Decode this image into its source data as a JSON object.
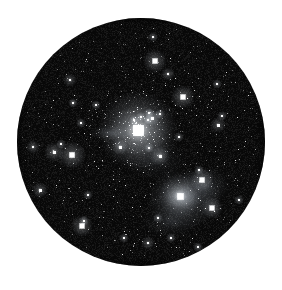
{
  "figure": {
    "kind": "astronomical-photograph",
    "presentation": "circular telescope field of view on white page",
    "caption": "",
    "background_color": "#ffffff",
    "sky_color": "#080808",
    "star_color": "#ffffff",
    "nebula_color": "#8f96a0"
  },
  "disc": {
    "center_x": 141,
    "center_y": 142,
    "radius": 124,
    "edge_softness_px": 2
  },
  "nebulae": [
    {
      "name": "central-glow",
      "x": 139,
      "y": 131,
      "rx": 30,
      "ry": 26,
      "intensity": 0.5,
      "tint": "#b9c2cc"
    },
    {
      "name": "western-streak",
      "x": 110,
      "y": 133,
      "rx": 22,
      "ry": 8,
      "intensity": 0.3,
      "tint": "#9aa3ad"
    },
    {
      "name": "southeast-complex",
      "x": 184,
      "y": 199,
      "rx": 38,
      "ry": 30,
      "intensity": 0.4,
      "tint": "#99a2ad"
    },
    {
      "name": "southeast-core",
      "x": 180,
      "y": 196,
      "rx": 16,
      "ry": 13,
      "intensity": 0.45,
      "tint": "#b3bcc6"
    },
    {
      "name": "southeast-extension",
      "x": 205,
      "y": 186,
      "rx": 26,
      "ry": 20,
      "intensity": 0.26,
      "tint": "#8d96a1"
    },
    {
      "name": "lower-haze",
      "x": 170,
      "y": 222,
      "rx": 30,
      "ry": 16,
      "intensity": 0.2,
      "tint": "#848d98"
    },
    {
      "name": "midfield-haze",
      "x": 155,
      "y": 160,
      "rx": 34,
      "ry": 22,
      "intensity": 0.16,
      "tint": "#7e8792"
    }
  ],
  "bright_stars": [
    {
      "name": "alpha-core",
      "x": 138,
      "y": 130,
      "size": 17,
      "halo": 40,
      "brightness": 1.0
    },
    {
      "name": "se-bright",
      "x": 180,
      "y": 196,
      "size": 9,
      "halo": 22,
      "brightness": 0.92
    },
    {
      "name": "w-pair-a",
      "x": 72,
      "y": 155,
      "size": 8,
      "halo": 14,
      "brightness": 0.9
    },
    {
      "name": "w-pair-b",
      "x": 54,
      "y": 152,
      "size": 6,
      "halo": 10,
      "brightness": 0.82
    },
    {
      "name": "n-bright",
      "x": 155,
      "y": 61,
      "size": 7,
      "halo": 12,
      "brightness": 0.88
    },
    {
      "name": "ne-bright",
      "x": 183,
      "y": 97,
      "size": 7,
      "halo": 12,
      "brightness": 0.88
    },
    {
      "name": "sw-bright",
      "x": 82,
      "y": 226,
      "size": 7,
      "halo": 11,
      "brightness": 0.86
    },
    {
      "name": "e-bright",
      "x": 202,
      "y": 180,
      "size": 7,
      "halo": 12,
      "brightness": 0.88
    },
    {
      "name": "se-edge",
      "x": 212,
      "y": 208,
      "size": 7,
      "halo": 11,
      "brightness": 0.86
    },
    {
      "name": "nw-field",
      "x": 40,
      "y": 190,
      "size": 5,
      "halo": 8,
      "brightness": 0.78
    },
    {
      "name": "sse-field",
      "x": 160,
      "y": 156,
      "size": 6,
      "halo": 10,
      "brightness": 0.84
    },
    {
      "name": "core-ne",
      "x": 152,
      "y": 118,
      "size": 5,
      "halo": 8,
      "brightness": 0.8
    },
    {
      "name": "core-sw",
      "x": 120,
      "y": 147,
      "size": 5,
      "halo": 8,
      "brightness": 0.8
    },
    {
      "name": "e-far",
      "x": 218,
      "y": 125,
      "size": 5,
      "halo": 8,
      "brightness": 0.76
    },
    {
      "name": "nne-field",
      "x": 168,
      "y": 74,
      "size": 4,
      "halo": 7,
      "brightness": 0.74
    },
    {
      "name": "s-field",
      "x": 148,
      "y": 243,
      "size": 4,
      "halo": 7,
      "brightness": 0.72
    },
    {
      "name": "w-far",
      "x": 33,
      "y": 147,
      "size": 4,
      "halo": 7,
      "brightness": 0.72
    },
    {
      "name": "nw-upper",
      "x": 70,
      "y": 80,
      "size": 4,
      "halo": 7,
      "brightness": 0.72
    }
  ],
  "field_star_count": 620,
  "noise": {
    "grain_amount": 0.35,
    "description": "photographic emulsion grain"
  }
}
